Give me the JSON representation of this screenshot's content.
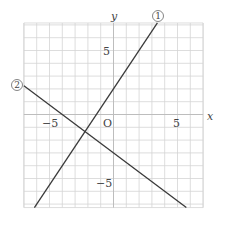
{
  "chart_data": {
    "type": "line",
    "title": "",
    "xlabel": "x",
    "ylabel": "y",
    "origin_label": "O",
    "xlim": [
      -7,
      7
    ],
    "ylim": [
      -7.27,
      7.15
    ],
    "grid": true,
    "grid_step": 1,
    "x_tick_labels": [
      {
        "value": -5,
        "label": "−5"
      },
      {
        "value": 5,
        "label": "5"
      }
    ],
    "y_tick_labels": [
      {
        "value": 5,
        "label": "5"
      },
      {
        "value": -5,
        "label": "−5"
      }
    ],
    "series": [
      {
        "name": "①",
        "equation": "y = 3/2 x + 2",
        "slope": 1.5,
        "intercept": 2,
        "points": [
          [
            -6.18,
            -7.27
          ],
          [
            3.43,
            7.15
          ]
        ]
      },
      {
        "name": "②",
        "equation": "y = -3/4 x - 3",
        "slope": -0.75,
        "intercept": -3,
        "points": [
          [
            -7,
            2.25
          ],
          [
            5.69,
            -7.27
          ]
        ]
      }
    ],
    "intersection": {
      "x": -2.22,
      "y": -1.33
    }
  },
  "labels": {
    "x_axis": "x",
    "y_axis": "y",
    "origin": "O",
    "x_tick_neg5": "−5",
    "x_tick_pos5": "5",
    "y_tick_pos5": "5",
    "y_tick_neg5": "−5",
    "line1": "1",
    "line2": "2"
  },
  "colors": {
    "grid": "#d4d4d4",
    "axis": "#bdbdbd",
    "line": "#3a3a3a",
    "text": "#444444"
  }
}
